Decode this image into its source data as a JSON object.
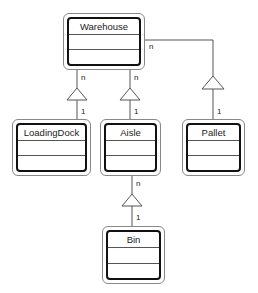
{
  "diagram": {
    "type": "UML class diagram (aggregation)",
    "classes": [
      {
        "id": "warehouse",
        "name": "Warehouse"
      },
      {
        "id": "loadingdock",
        "name": "LoadingDock"
      },
      {
        "id": "aisle",
        "name": "Aisle"
      },
      {
        "id": "pallet",
        "name": "Pallet"
      },
      {
        "id": "bin",
        "name": "Bin"
      }
    ],
    "relations": [
      {
        "from": "Warehouse",
        "to": "LoadingDock",
        "whole_multiplicity": "n",
        "part_multiplicity": "1"
      },
      {
        "from": "Warehouse",
        "to": "Aisle",
        "whole_multiplicity": "n",
        "part_multiplicity": "1"
      },
      {
        "from": "Warehouse",
        "to": "Pallet",
        "whole_multiplicity": "n",
        "part_multiplicity": "1"
      },
      {
        "from": "Aisle",
        "to": "Bin",
        "whole_multiplicity": "n",
        "part_multiplicity": "1"
      }
    ],
    "labels": {
      "wh_ld_n": "n",
      "wh_ld_1": "1",
      "wh_ai_n": "n",
      "wh_ai_1": "1",
      "wh_pa_n": "n",
      "wh_pa_1": "1",
      "ai_bi_n": "n",
      "ai_bi_1": "1"
    },
    "colors": {
      "line": "#555555",
      "box_border": "#111111",
      "text": "#222222"
    }
  }
}
